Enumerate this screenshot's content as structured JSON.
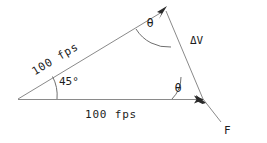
{
  "diagram": {
    "background_color": "#ffffff",
    "line_color": "#8a8a8a",
    "text_color": "#1d1d1d",
    "labels": {
      "incoming_speed": "100 fps",
      "outgoing_speed": "100 fps",
      "incidence_angle": "45°",
      "theta_top": "θ",
      "theta_bottom": "θ",
      "delta_v": "ΔV",
      "force": "F"
    },
    "geometry": {
      "left_vertex": [
        18,
        99
      ],
      "top_vertex": [
        166,
        9
      ],
      "right_vertex": [
        203,
        99
      ],
      "force_tip": [
        221,
        122
      ]
    }
  }
}
